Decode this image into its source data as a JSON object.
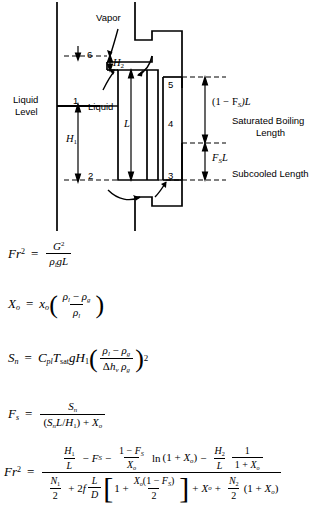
{
  "figure": {
    "diagram": {
      "labels": {
        "vapor": "Vapor",
        "liquid_level_l1": "Liquid",
        "liquid_level_l2": "Level",
        "liquid": "Liquid",
        "saturated_boiling_l1": "Saturated Boiling",
        "saturated_boiling_l2": "Length",
        "subcooled": "Subcooled Length"
      },
      "station_numbers": [
        "1",
        "2",
        "3",
        "4",
        "5",
        "6"
      ],
      "dimensions": {
        "h1": "H",
        "h1_sub": "1",
        "h2": "H",
        "h2_sub": "2",
        "length": "L",
        "sat_boiling_length": "(1 − F",
        "sat_boiling_length_sub": "S",
        "sat_boiling_length_tail": ")L",
        "subcooled_length": "F",
        "subcooled_length_sub": "S",
        "subcooled_length_tail": "L"
      }
    },
    "equations": [
      {
        "id": "froude-number",
        "lhs": "Fr",
        "lhs_sup": "2",
        "rhs_numerator": "G²",
        "rhs_denominator": "ρₗ g L"
      },
      {
        "id": "exit-quality",
        "lhs": "X",
        "lhs_sub": "o",
        "rhs": "xₒ ((ρₗ − ρᵧ)/ρₗ)"
      },
      {
        "id": "subcooling-number",
        "lhs": "S",
        "lhs_sub": "n",
        "rhs": "Cₚₗ Tₛₐₜ g H₁ ((ρₗ − ρᵧ)/(Δhᵥ ρᵧ))²"
      },
      {
        "id": "subcooled-fraction",
        "lhs": "F",
        "lhs_sub": "s",
        "rhs_numerator": "Sₙ",
        "rhs_denominator": "(SₙL/H₁) + Xₒ"
      },
      {
        "id": "froude-number-full",
        "lhs": "Fr",
        "lhs_sup": "2"
      }
    ],
    "symbols": {
      "Fr": "Fr",
      "G": "G",
      "rho": "ρ",
      "g": "g",
      "L": "L",
      "D": "D",
      "X": "X",
      "x": "x",
      "S": "S",
      "C": "C",
      "T": "T",
      "H": "H",
      "F": "F",
      "N": "N",
      "f": "f",
      "delta_h": "Δh",
      "ln": "ln",
      "sat": "sat",
      "pl": "pl",
      "one": "1",
      "two": "2",
      "minus": "−",
      "plus": "+",
      "equals": "="
    }
  }
}
